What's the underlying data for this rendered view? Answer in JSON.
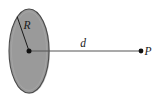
{
  "figure": {
    "type": "physics-diagram",
    "background_color": "#ffffff",
    "disk": {
      "name": "charged-disk",
      "shape": "ellipse",
      "label": "R",
      "label_meaning": "radius",
      "fill_color": "#9a9a9a",
      "stroke_color": "#4a4a4a",
      "center_x": 29,
      "center_y": 51,
      "radius_x": 20,
      "radius_y": 42
    },
    "radius_line": {
      "name": "radius-line",
      "label": "R",
      "from_x": 29,
      "from_y": 51,
      "to_x": 17,
      "to_y": 17,
      "stroke_color": "#1a1a1a"
    },
    "center_point": {
      "name": "disk-center-point",
      "x": 29,
      "y": 51,
      "color": "#111111"
    },
    "distance_line": {
      "name": "distance-line",
      "label": "d",
      "label_meaning": "distance from disk to point P",
      "from_x": 29,
      "from_y": 51,
      "to_x": 141,
      "to_y": 51,
      "stroke_color": "#555555"
    },
    "field_point": {
      "name": "field-point-P",
      "label": "P",
      "x": 141,
      "y": 51,
      "color": "#111111"
    },
    "labels": {
      "radius": "R",
      "distance": "d",
      "point": "P"
    }
  }
}
